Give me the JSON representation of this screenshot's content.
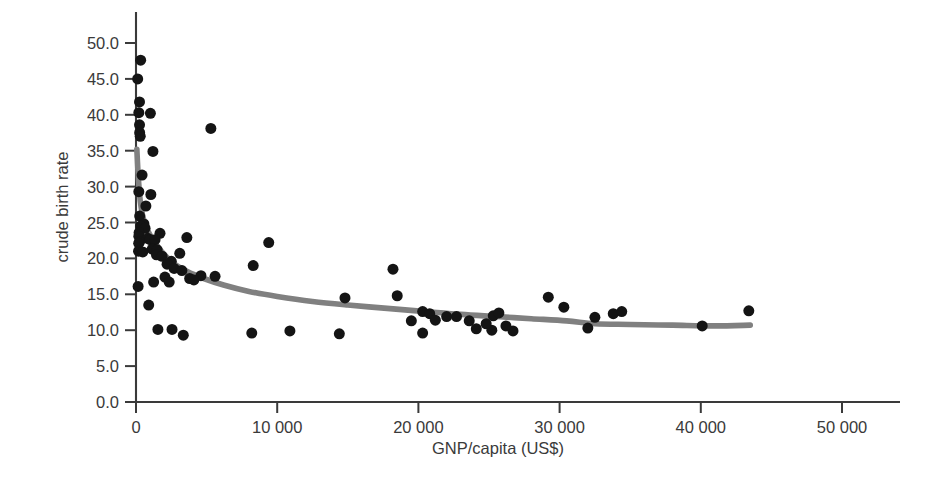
{
  "chart_data": {
    "type": "scatter",
    "title": "",
    "xlabel": "GNP/capita (US$)",
    "ylabel": "crude birth rate",
    "xlim": [
      0,
      52000
    ],
    "ylim": [
      0,
      52
    ],
    "grid": false,
    "legend": "none",
    "xticks": [
      0,
      10000,
      20000,
      30000,
      40000,
      50000
    ],
    "xtick_labels": [
      "0",
      "10 000",
      "20 000",
      "30 000",
      "40 000",
      "50 000"
    ],
    "yticks": [
      0,
      5,
      10,
      15,
      20,
      25,
      30,
      35,
      40,
      45,
      50
    ],
    "ytick_labels": [
      "0.0",
      "5.0",
      "10.0",
      "15.0",
      "20.0",
      "25.0",
      "30.0",
      "35.0",
      "40.0",
      "45.0",
      "50.0"
    ],
    "marker": "filled-circle",
    "marker_color": "#141414",
    "marker_size_px": 11,
    "trend_color": "#808080",
    "trend_label": "smoothed trend line",
    "points": [
      [
        330,
        47.6
      ],
      [
        120,
        45.0
      ],
      [
        250,
        41.8
      ],
      [
        200,
        40.3
      ],
      [
        1020,
        40.2
      ],
      [
        250,
        38.6
      ],
      [
        260,
        37.5
      ],
      [
        300,
        37.0
      ],
      [
        1200,
        34.9
      ],
      [
        430,
        31.6
      ],
      [
        200,
        29.3
      ],
      [
        1050,
        28.9
      ],
      [
        700,
        27.3
      ],
      [
        260,
        25.9
      ],
      [
        560,
        24.8
      ],
      [
        330,
        24.5
      ],
      [
        640,
        24.2
      ],
      [
        220,
        23.6
      ],
      [
        1700,
        23.5
      ],
      [
        200,
        23.1
      ],
      [
        830,
        22.8
      ],
      [
        1000,
        22.6
      ],
      [
        1350,
        22.6
      ],
      [
        250,
        22.3
      ],
      [
        190,
        22.1
      ],
      [
        9400,
        22.2
      ],
      [
        1150,
        21.3
      ],
      [
        1500,
        21.2
      ],
      [
        180,
        21.0
      ],
      [
        480,
        20.9
      ],
      [
        1450,
        20.5
      ],
      [
        1850,
        20.3
      ],
      [
        3600,
        22.9
      ],
      [
        3100,
        20.7
      ],
      [
        2500,
        19.6
      ],
      [
        8300,
        19.0
      ],
      [
        2200,
        19.2
      ],
      [
        2700,
        18.6
      ],
      [
        18200,
        18.5
      ],
      [
        3250,
        18.3
      ],
      [
        4600,
        17.6
      ],
      [
        5300,
        38.1
      ],
      [
        2050,
        17.4
      ],
      [
        3800,
        17.2
      ],
      [
        4100,
        17.0
      ],
      [
        150,
        16.1
      ],
      [
        1250,
        16.7
      ],
      [
        2350,
        16.7
      ],
      [
        5600,
        17.5
      ],
      [
        14800,
        14.5
      ],
      [
        18500,
        14.8
      ],
      [
        29200,
        14.6
      ],
      [
        30300,
        13.2
      ],
      [
        900,
        13.5
      ],
      [
        20300,
        12.6
      ],
      [
        20800,
        12.3
      ],
      [
        22000,
        11.9
      ],
      [
        22700,
        11.9
      ],
      [
        25300,
        12.0
      ],
      [
        25700,
        12.4
      ],
      [
        32500,
        11.8
      ],
      [
        33800,
        12.3
      ],
      [
        34400,
        12.6
      ],
      [
        43400,
        12.7
      ],
      [
        40100,
        10.6
      ],
      [
        1550,
        10.1
      ],
      [
        2550,
        10.1
      ],
      [
        3350,
        9.3
      ],
      [
        8200,
        9.6
      ],
      [
        10900,
        9.9
      ],
      [
        14400,
        9.5
      ],
      [
        20300,
        9.6
      ],
      [
        24100,
        10.2
      ],
      [
        25200,
        10.0
      ],
      [
        26700,
        9.9
      ],
      [
        26200,
        10.6
      ],
      [
        32000,
        10.3
      ],
      [
        23600,
        11.3
      ],
      [
        24800,
        10.9
      ],
      [
        19500,
        11.3
      ],
      [
        21200,
        11.4
      ]
    ],
    "trend_curve": [
      [
        60,
        35.2
      ],
      [
        160,
        31.4
      ],
      [
        300,
        28.0
      ],
      [
        500,
        25.7
      ],
      [
        800,
        24.0
      ],
      [
        1200,
        22.6
      ],
      [
        1800,
        21.0
      ],
      [
        2600,
        19.4
      ],
      [
        3600,
        18.2
      ],
      [
        4800,
        17.2
      ],
      [
        6200,
        16.3
      ],
      [
        8000,
        15.4
      ],
      [
        10000,
        14.7
      ],
      [
        12500,
        14.0
      ],
      [
        15000,
        13.5
      ],
      [
        18000,
        13.0
      ],
      [
        20500,
        12.6
      ],
      [
        23000,
        12.2
      ],
      [
        25500,
        11.9
      ],
      [
        28000,
        11.6
      ],
      [
        30500,
        11.3
      ],
      [
        32500,
        10.9
      ],
      [
        35000,
        10.8
      ],
      [
        38000,
        10.7
      ],
      [
        41000,
        10.6
      ],
      [
        43500,
        10.7
      ]
    ]
  }
}
